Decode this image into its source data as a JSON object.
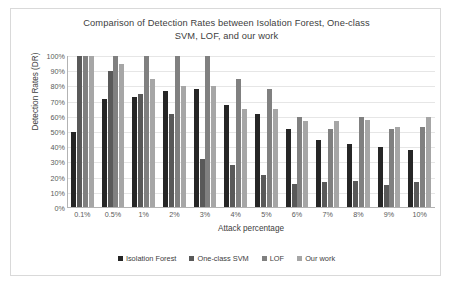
{
  "chart_data": {
    "type": "bar",
    "title": "Comparison of Detection Rates between Isolation Forest, One-class SVM, LOF, and our work",
    "title_line1": "Comparison of Detection Rates between Isolation Forest, One-class",
    "title_line2": "SVM, LOF, and our work",
    "xlabel": "Attack percentage",
    "ylabel": "Detection Rates (DR)",
    "ylim": [
      0,
      100
    ],
    "grid": true,
    "legend_position": "bottom",
    "categories": [
      "0.1%",
      "0.5%",
      "1%",
      "2%",
      "3%",
      "4%",
      "5%",
      "6%",
      "7%",
      "8%",
      "9%",
      "10%"
    ],
    "ytick_labels": [
      "0%",
      "10%",
      "20%",
      "30%",
      "40%",
      "50%",
      "60%",
      "70%",
      "80%",
      "90%",
      "100%"
    ],
    "ytick_values": [
      0,
      10,
      20,
      30,
      40,
      50,
      60,
      70,
      80,
      90,
      100
    ],
    "series": [
      {
        "name": "Isolation Forest",
        "color": "#262626",
        "values": [
          50,
          72,
          73,
          77,
          78,
          68,
          62,
          52,
          45,
          42,
          40,
          38
        ]
      },
      {
        "name": "One-class SVM",
        "color": "#595959",
        "values": [
          100,
          90,
          75,
          62,
          32,
          28,
          22,
          16,
          17,
          18,
          15,
          17
        ]
      },
      {
        "name": "LOF",
        "color": "#808080",
        "values": [
          100,
          100,
          100,
          100,
          100,
          85,
          78,
          60,
          52,
          60,
          52,
          53
        ]
      },
      {
        "name": "Our work",
        "color": "#a6a6a6",
        "values": [
          100,
          95,
          85,
          80,
          80,
          65,
          65,
          57,
          57,
          58,
          53,
          60
        ]
      }
    ]
  }
}
